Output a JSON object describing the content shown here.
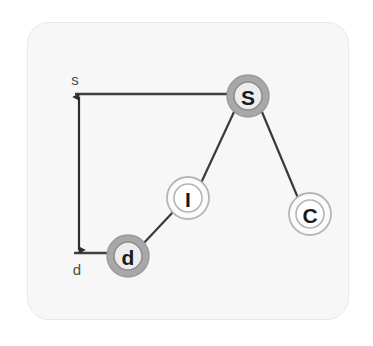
{
  "figure": {
    "kind": "node-link-tree-diagram",
    "panel": {
      "background_color": "#f7f7f7",
      "border_color": "#e8e8e8",
      "corner_radius": 22
    }
  },
  "nodes": [
    {
      "id": "S",
      "label": "S",
      "name": "node-s",
      "cx": 248,
      "cy": 96,
      "outer_radius": 21,
      "inner_radius": 14,
      "style": "filled-gray-ring",
      "outer_fill": "#a8a8a8",
      "inner_fill": "#ededed",
      "stroke_color": "#8f8f8f",
      "label_color": "#1a1a1a"
    },
    {
      "id": "I",
      "label": "I",
      "name": "node-i",
      "cx": 188,
      "cy": 198,
      "outer_radius": 21,
      "inner_radius": 14,
      "style": "outline-double-ring",
      "outer_fill": "#fbfbfb",
      "inner_fill": "#ffffff",
      "stroke_color": "#b5b5b5",
      "label_color": "#1a1a1a"
    },
    {
      "id": "C",
      "label": "C",
      "name": "node-c",
      "cx": 310,
      "cy": 214,
      "outer_radius": 21,
      "inner_radius": 14,
      "style": "outline-double-ring",
      "outer_fill": "#fbfbfb",
      "inner_fill": "#ffffff",
      "stroke_color": "#b5b5b5",
      "label_color": "#1a1a1a"
    },
    {
      "id": "d",
      "label": "d",
      "name": "node-d",
      "cx": 128,
      "cy": 256,
      "outer_radius": 21,
      "inner_radius": 14,
      "style": "filled-gray-ring",
      "outer_fill": "#a8a8a8",
      "inner_fill": "#ededed",
      "stroke_color": "#8f8f8f",
      "label_color": "#1a1a1a"
    }
  ],
  "edges": [
    {
      "name": "edge-s-i",
      "from": "S",
      "to": "I",
      "x1": 234,
      "y1": 112,
      "x2": 201,
      "y2": 183,
      "color": "#3a3a3a",
      "width": 2.2
    },
    {
      "name": "edge-s-c",
      "from": "S",
      "to": "C",
      "x1": 262,
      "y1": 112,
      "x2": 298,
      "y2": 198,
      "color": "#3a3a3a",
      "width": 2.2
    },
    {
      "name": "edge-i-d",
      "from": "I",
      "to": "d",
      "x1": 174,
      "y1": 211,
      "x2": 142,
      "y2": 245,
      "color": "#3a3a3a",
      "width": 2.2
    }
  ],
  "measure": {
    "name": "depth-measure",
    "top_guide": {
      "name": "top-guide-line",
      "x1": 75,
      "y1": 94,
      "x2": 234,
      "y2": 94,
      "color": "#3f3f3f",
      "width": 2.4
    },
    "bottom_guide": {
      "name": "bottom-guide-line",
      "x1": 74,
      "y1": 253,
      "x2": 113,
      "y2": 253,
      "color": "#3f3f3f",
      "width": 2.4
    },
    "arrow_line": {
      "name": "vertical-double-arrow",
      "x": 79,
      "y_top": 96,
      "y_bottom": 251,
      "color": "#2e2e2e",
      "width": 2.2
    },
    "top_label": {
      "name": "measure-label-s",
      "text": "s",
      "x": 75,
      "y": 79
    },
    "bottom_label": {
      "name": "measure-label-d",
      "text": "d",
      "x": 77,
      "y": 268
    }
  }
}
